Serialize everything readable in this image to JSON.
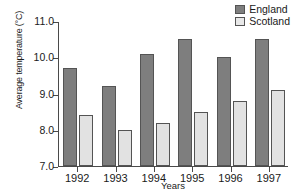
{
  "chart_data": {
    "type": "bar",
    "title": "",
    "xlabel": "Years",
    "ylabel": "Average temperature (°C)",
    "categories": [
      "1992",
      "1993",
      "1994",
      "1995",
      "1996",
      "1997"
    ],
    "series": [
      {
        "name": "England",
        "color": "#7e7e7e",
        "values": [
          9.7,
          9.2,
          10.1,
          10.5,
          10.0,
          10.5
        ]
      },
      {
        "name": "Scotland",
        "color": "#e2e2e2",
        "values": [
          8.4,
          8.0,
          8.2,
          8.5,
          8.8,
          9.1
        ]
      }
    ],
    "ylim": [
      7.0,
      11.0
    ],
    "ytick_labels": [
      "11.0",
      "10.0",
      "9.0",
      "8.0",
      "7.0"
    ],
    "ytick_values": [
      11.0,
      10.0,
      9.0,
      8.0,
      7.0
    ],
    "grid": false,
    "legend_position": "top-right"
  }
}
